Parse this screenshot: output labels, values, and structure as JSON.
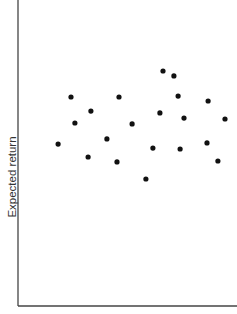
{
  "chart_data": {
    "type": "scatter",
    "title": "",
    "xlabel": "",
    "ylabel": "Expected return",
    "xlim": [
      0,
      100
    ],
    "ylim": [
      0,
      100
    ],
    "grid": false,
    "legend": null,
    "ticks": false,
    "marker_color": "#111111",
    "axis_color": "#444444",
    "series": [
      {
        "name": "assets",
        "points": [
          {
            "x": 18.3,
            "y": 52.9
          },
          {
            "x": 24.2,
            "y": 68.3
          },
          {
            "x": 26.0,
            "y": 59.8
          },
          {
            "x": 33.3,
            "y": 63.7
          },
          {
            "x": 32.0,
            "y": 48.7
          },
          {
            "x": 40.6,
            "y": 54.6
          },
          {
            "x": 46.1,
            "y": 68.3
          },
          {
            "x": 45.2,
            "y": 47.1
          },
          {
            "x": 52.1,
            "y": 59.5
          },
          {
            "x": 58.4,
            "y": 41.5
          },
          {
            "x": 61.6,
            "y": 51.6
          },
          {
            "x": 64.8,
            "y": 63.1
          },
          {
            "x": 66.2,
            "y": 76.8
          },
          {
            "x": 71.2,
            "y": 75.2
          },
          {
            "x": 73.1,
            "y": 68.6
          },
          {
            "x": 75.8,
            "y": 61.4
          },
          {
            "x": 74.0,
            "y": 51.3
          },
          {
            "x": 86.3,
            "y": 53.3
          },
          {
            "x": 86.8,
            "y": 67.0
          },
          {
            "x": 91.3,
            "y": 47.4
          },
          {
            "x": 94.5,
            "y": 61.1
          }
        ]
      }
    ]
  }
}
